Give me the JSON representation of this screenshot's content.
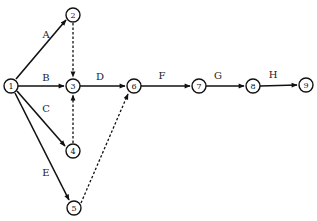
{
  "diagram": {
    "type": "activity-on-arrow network",
    "nodes": [
      {
        "id": "1",
        "x": 11,
        "y": 86
      },
      {
        "id": "2",
        "x": 73,
        "y": 15
      },
      {
        "id": "3",
        "x": 73,
        "y": 86
      },
      {
        "id": "4",
        "x": 73,
        "y": 151
      },
      {
        "id": "5",
        "x": 74,
        "y": 208
      },
      {
        "id": "6",
        "x": 134,
        "y": 86
      },
      {
        "id": "7",
        "x": 199,
        "y": 86
      },
      {
        "id": "8",
        "x": 253,
        "y": 86
      },
      {
        "id": "9",
        "x": 306,
        "y": 85
      }
    ],
    "edges": [
      {
        "from": "1",
        "to": "2",
        "label": "A",
        "style": "solid"
      },
      {
        "from": "1",
        "to": "3",
        "label": "B",
        "style": "solid"
      },
      {
        "from": "1",
        "to": "4",
        "label": "C",
        "style": "solid"
      },
      {
        "from": "1",
        "to": "5",
        "label": "E",
        "style": "solid"
      },
      {
        "from": "2",
        "to": "3",
        "label": "",
        "style": "dashed"
      },
      {
        "from": "4",
        "to": "3",
        "label": "",
        "style": "dashed"
      },
      {
        "from": "3",
        "to": "6",
        "label": "D",
        "style": "solid"
      },
      {
        "from": "5",
        "to": "6",
        "label": "",
        "style": "dashed"
      },
      {
        "from": "6",
        "to": "7",
        "label": "F",
        "style": "solid"
      },
      {
        "from": "7",
        "to": "8",
        "label": "G",
        "style": "solid"
      },
      {
        "from": "8",
        "to": "9",
        "label": "H",
        "style": "solid"
      }
    ],
    "labels": {
      "A": "A",
      "B": "B",
      "C": "C",
      "D": "D",
      "E": "E",
      "F": "F",
      "G": "G",
      "H": "H"
    },
    "node_labels": {
      "n1": "1",
      "n2": "2",
      "n3": "3",
      "n4": "4",
      "n5": "5",
      "n6": "6",
      "n7": "7",
      "n8": "8",
      "n9": "9"
    }
  }
}
